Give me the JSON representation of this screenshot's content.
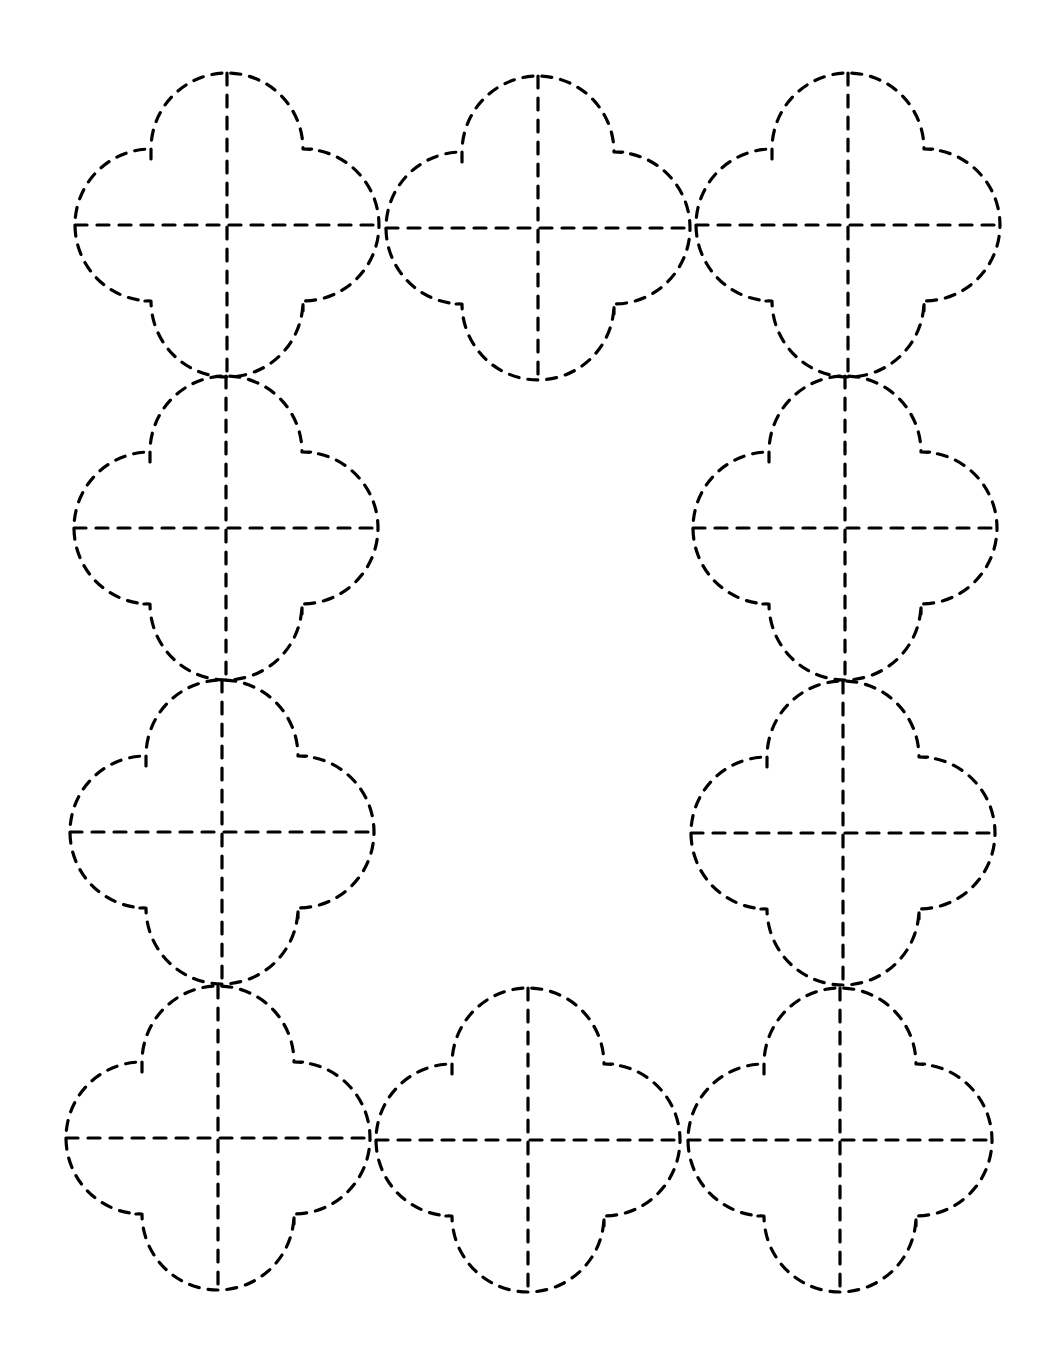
{
  "page": {
    "title": "",
    "background": "#ffffff",
    "stroke_color": "#000000"
  },
  "pattern": {
    "description": "Rectangular frame of dashed quatrefoil tracing shapes, each with dashed horizontal and vertical center axes",
    "shape_radius": 152,
    "notch_offset": 76,
    "shapes": [
      {
        "id": "top-left",
        "cx": 227,
        "cy": 225
      },
      {
        "id": "top-middle",
        "cx": 538,
        "cy": 228
      },
      {
        "id": "top-right",
        "cx": 848,
        "cy": 225
      },
      {
        "id": "left-upper",
        "cx": 226,
        "cy": 528
      },
      {
        "id": "left-lower",
        "cx": 222,
        "cy": 832
      },
      {
        "id": "right-upper",
        "cx": 845,
        "cy": 528
      },
      {
        "id": "right-lower",
        "cx": 843,
        "cy": 833
      },
      {
        "id": "bottom-left",
        "cx": 218,
        "cy": 1138
      },
      {
        "id": "bottom-middle",
        "cx": 528,
        "cy": 1140
      },
      {
        "id": "bottom-right",
        "cx": 840,
        "cy": 1140
      }
    ]
  }
}
